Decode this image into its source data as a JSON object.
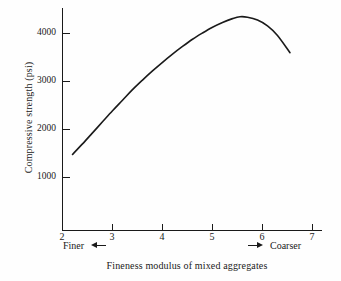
{
  "figure": {
    "background_color": "#fefefe",
    "ink_color": "#1a1a1a"
  },
  "chart_data": {
    "type": "line",
    "title": "",
    "xlabel": "Fineness modulus of mixed aggregates",
    "ylabel": "Compressive strength (psi)",
    "xlim": [
      2,
      7.25
    ],
    "ylim": [
      0,
      4600
    ],
    "grid": false,
    "legend": null,
    "xticks": [
      2,
      3,
      4,
      5,
      6,
      7
    ],
    "xtick_labels": [
      "2",
      "3",
      "4",
      "5",
      "6",
      "7"
    ],
    "yticks": [
      1000,
      2000,
      3000,
      4000
    ],
    "ytick_labels": [
      "1000",
      "2000",
      "3000",
      "4000"
    ],
    "series": [
      {
        "name": "Compressive strength",
        "color": "#1a1a1a",
        "line_width": 1.6,
        "x": [
          2.2,
          2.4,
          2.6,
          2.8,
          3.0,
          3.2,
          3.4,
          3.6,
          3.8,
          4.0,
          4.2,
          4.4,
          4.6,
          4.8,
          5.0,
          5.2,
          5.4,
          5.55,
          5.7,
          5.9,
          6.1,
          6.3,
          6.55
        ],
        "y": [
          1480,
          1700,
          1930,
          2160,
          2390,
          2610,
          2830,
          3030,
          3220,
          3400,
          3570,
          3730,
          3880,
          4010,
          4130,
          4230,
          4310,
          4350,
          4340,
          4280,
          4160,
          3960,
          3600
        ]
      }
    ],
    "annotations": [
      {
        "id": "finer",
        "text": "Finer",
        "arrow": "left",
        "position": "below-axis-left"
      },
      {
        "id": "coarser",
        "text": "Coarser",
        "arrow": "right",
        "position": "below-axis-right"
      }
    ],
    "peak": {
      "x": 5.55,
      "y": 4350
    },
    "start_point": {
      "x": 2.2,
      "y": 1480
    },
    "end_point": {
      "x": 6.55,
      "y": 3600
    }
  },
  "axes": {
    "y_title": "Compressive strength (psi)",
    "x_title": "Fineness modulus of mixed aggregates"
  },
  "ticks": {
    "y": [
      "4000",
      "3000",
      "2000",
      "1000"
    ],
    "x": [
      "2",
      "3",
      "4",
      "5",
      "6",
      "7"
    ]
  },
  "notes": {
    "finer_label": "Finer",
    "coarser_label": "Coarser"
  },
  "edge_fragments": {
    "line1": "",
    "line2": "",
    "line3": ""
  }
}
